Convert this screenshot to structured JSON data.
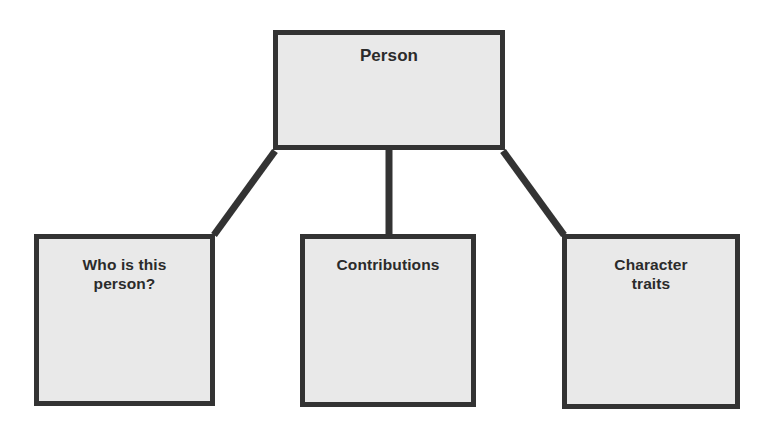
{
  "diagram": {
    "type": "hierarchy-tree",
    "background_color": "#ffffff",
    "node_fill_color": "#e9e9e9",
    "node_border_color": "#333333",
    "connector_color": "#333333",
    "text_color": "#2b2b2b",
    "root": {
      "id": "person",
      "label": "Person"
    },
    "children": [
      {
        "id": "who",
        "label": "Who is this\nperson?"
      },
      {
        "id": "contributions",
        "label": "Contributions"
      },
      {
        "id": "character",
        "label": "Character\ntraits"
      }
    ],
    "connectors": [
      {
        "id": "person-to-who",
        "from": "person",
        "to": "who",
        "shape": "diagonal-left"
      },
      {
        "id": "person-to-contributions",
        "from": "person",
        "to": "contributions",
        "shape": "vertical"
      },
      {
        "id": "person-to-character",
        "from": "person",
        "to": "character",
        "shape": "diagonal-right"
      }
    ]
  }
}
